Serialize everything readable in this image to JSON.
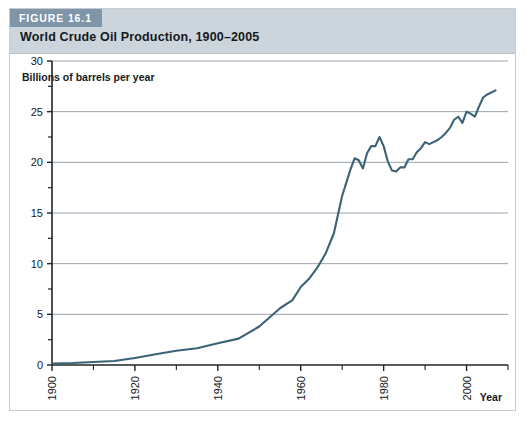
{
  "figure": {
    "tag": "FIGURE 16.1",
    "title": "World Crude Oil Production, 1900–2005",
    "tag_bg": "#7e96a8",
    "header_bg": "#ccd5dc",
    "frame_border": "#c6ccd2"
  },
  "chart_data": {
    "type": "line",
    "title": "World Crude Oil Production, 1900–2005",
    "subtitle": "",
    "xlabel": "Year",
    "ylabel": "Billions of barrels per year",
    "ylabel_full": "Billions of barrels per year",
    "xlim": [
      1900,
      2010
    ],
    "ylim": [
      0,
      30
    ],
    "grid": "horizontal",
    "legend": "none",
    "line_color": "#3c6375",
    "gridline_color": "#8d9aa6",
    "axis_color": "#1c2428",
    "ytick_labels": [
      "0",
      "5",
      "10",
      "15",
      "20",
      "25",
      "30"
    ],
    "yticks": [
      0,
      5,
      10,
      15,
      20,
      25,
      30
    ],
    "yticks_minor": [
      2.5,
      7.5,
      12.5,
      17.5,
      22.5,
      27.5
    ],
    "xtick_labels": [
      "1900",
      "1920",
      "1940",
      "1960",
      "1980",
      "2000"
    ],
    "xticks": [
      1900,
      1920,
      1940,
      1960,
      1980,
      2000
    ],
    "xticks_minor": [
      1910,
      1930,
      1950,
      1970,
      1990,
      2010
    ],
    "series": [
      {
        "name": "World crude oil production",
        "unit": "billions of barrels per year",
        "x": [
          1900,
          1905,
          1910,
          1915,
          1920,
          1925,
          1930,
          1935,
          1940,
          1945,
          1950,
          1955,
          1958,
          1960,
          1962,
          1964,
          1966,
          1968,
          1970,
          1971,
          1972,
          1973,
          1974,
          1975,
          1976,
          1977,
          1978,
          1979,
          1980,
          1981,
          1982,
          1983,
          1984,
          1985,
          1986,
          1987,
          1988,
          1989,
          1990,
          1991,
          1992,
          1993,
          1994,
          1995,
          1996,
          1997,
          1998,
          1999,
          2000,
          2001,
          2002,
          2003,
          2004,
          2005,
          2007
        ],
        "y": [
          0.15,
          0.2,
          0.3,
          0.4,
          0.69,
          1.07,
          1.41,
          1.66,
          2.15,
          2.6,
          3.8,
          5.6,
          6.4,
          7.7,
          8.5,
          9.6,
          11.0,
          13.0,
          16.7,
          18.0,
          19.3,
          20.4,
          20.2,
          19.4,
          20.9,
          21.6,
          21.6,
          22.5,
          21.6,
          20.1,
          19.2,
          19.1,
          19.5,
          19.5,
          20.3,
          20.3,
          21.0,
          21.4,
          22.0,
          21.8,
          22.0,
          22.2,
          22.5,
          22.9,
          23.4,
          24.2,
          24.5,
          23.9,
          25.0,
          24.8,
          24.5,
          25.5,
          26.4,
          26.7,
          27.1
        ]
      }
    ],
    "annotations": []
  }
}
